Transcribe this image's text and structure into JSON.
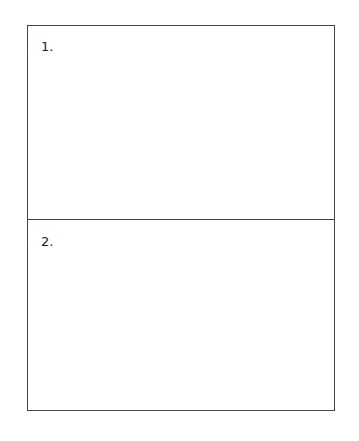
{
  "document": {
    "sections": [
      {
        "label": "1."
      },
      {
        "label": "2."
      }
    ]
  }
}
